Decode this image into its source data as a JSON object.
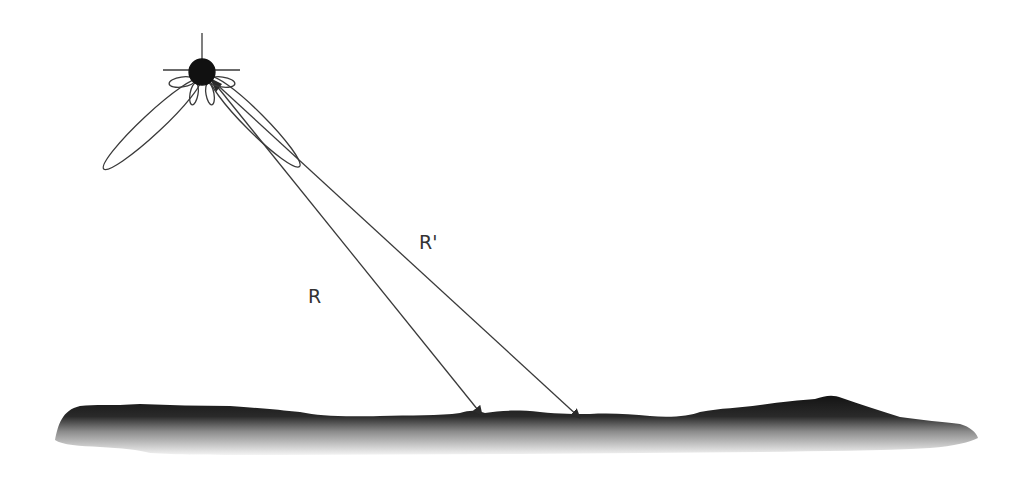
{
  "diagram": {
    "type": "radar-geometry",
    "labels": {
      "range": "R",
      "range_prime": "R'"
    },
    "colors": {
      "line": "#3a3a3a",
      "antenna_body": "#111111",
      "terrain_top": "#1a1a1a",
      "terrain_bottom": "#ffffff",
      "background": "#ffffff"
    },
    "elements": [
      {
        "id": "antenna",
        "kind": "antenna-dot",
        "x": 202,
        "y": 72
      },
      {
        "id": "main-lobe-left",
        "kind": "radiation-lobe",
        "tip_x": 105,
        "tip_y": 170
      },
      {
        "id": "main-lobe-right",
        "kind": "radiation-lobe",
        "tip_x": 298,
        "tip_y": 168
      },
      {
        "id": "range-R",
        "kind": "arrow",
        "from": [
          215,
          82
        ],
        "to": [
          482,
          415
        ]
      },
      {
        "id": "range-R-prime",
        "kind": "arrow",
        "from": [
          215,
          82
        ],
        "to": [
          580,
          418
        ]
      },
      {
        "id": "terrain",
        "kind": "ground-profile",
        "x_start": 55,
        "x_end": 978
      }
    ]
  }
}
